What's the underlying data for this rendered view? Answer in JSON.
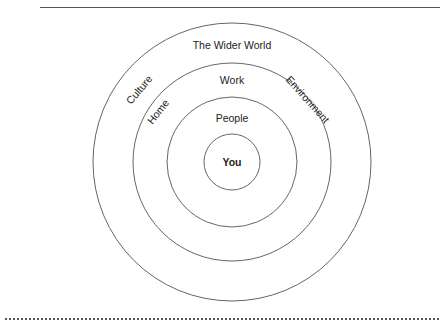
{
  "diagram": {
    "center": {
      "label": "You"
    },
    "rings": [
      {
        "label": "People"
      },
      {
        "label": "Work"
      },
      {
        "label": "Home"
      },
      {
        "label": "Environment"
      },
      {
        "label": "The Wider World"
      },
      {
        "label": "Culture"
      }
    ],
    "line_color": "#666666"
  }
}
